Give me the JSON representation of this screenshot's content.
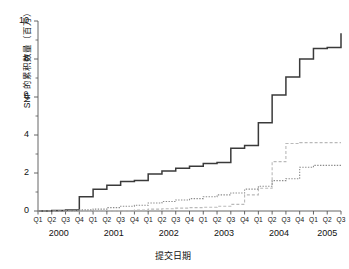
{
  "chart_data": {
    "type": "line",
    "subtype": "step",
    "title": "",
    "xlabel": "提交日期",
    "ylabel": "SNP 的累积数量（百万）",
    "ylim": [
      0,
      10
    ],
    "yticks": [
      0,
      2,
      4,
      6,
      8,
      10
    ],
    "yticks_minor": [
      1,
      3,
      5,
      7,
      9
    ],
    "grid": false,
    "legend": "none",
    "x_quarter_labels": [
      "Q1",
      "Q2",
      "Q3",
      "Q4",
      "Q1",
      "Q2",
      "Q3",
      "Q4",
      "Q1",
      "Q2",
      "Q3",
      "Q4",
      "Q1",
      "Q2",
      "Q3",
      "Q4",
      "Q1",
      "Q2",
      "Q3",
      "Q4",
      "Q1",
      "Q2",
      "Q3"
    ],
    "x_year_labels": [
      "2000",
      "2001",
      "2002",
      "2003",
      "2004",
      "2005"
    ],
    "x_year_spans": [
      4,
      4,
      4,
      4,
      4,
      3
    ],
    "x": [
      "2000Q1",
      "2000Q2",
      "2000Q3",
      "2000Q4",
      "2001Q1",
      "2001Q2",
      "2001Q3",
      "2001Q4",
      "2002Q1",
      "2002Q2",
      "2002Q3",
      "2002Q4",
      "2003Q1",
      "2003Q2",
      "2003Q3",
      "2003Q4",
      "2004Q1",
      "2004Q2",
      "2004Q3",
      "2004Q4",
      "2005Q1",
      "2005Q2",
      "2005Q3"
    ],
    "series": [
      {
        "name": "submitted-snps-total",
        "style": "solid",
        "color": "#3a3a3a",
        "values": [
          0.0,
          0.02,
          0.05,
          0.75,
          1.15,
          1.35,
          1.55,
          1.6,
          1.95,
          2.1,
          2.25,
          2.35,
          2.5,
          2.55,
          3.3,
          3.45,
          4.65,
          6.1,
          7.05,
          8.0,
          8.55,
          8.6,
          9.35
        ]
      },
      {
        "name": "validated-snps",
        "style": "dashed",
        "color": "#b9b9b9",
        "values": [
          0.0,
          0.0,
          0.0,
          0.0,
          0.0,
          0.0,
          0.0,
          0.05,
          0.1,
          0.12,
          0.15,
          0.18,
          0.2,
          0.25,
          0.35,
          0.85,
          1.2,
          2.6,
          3.55,
          3.6,
          3.6,
          3.6,
          3.6
        ]
      },
      {
        "name": "reference-snps",
        "style": "dotted",
        "color": "#8c8c8c",
        "values": [
          0.0,
          0.0,
          0.02,
          0.06,
          0.1,
          0.18,
          0.25,
          0.3,
          0.42,
          0.5,
          0.58,
          0.65,
          0.75,
          0.85,
          0.95,
          1.15,
          1.3,
          1.6,
          1.7,
          2.3,
          2.4,
          2.4,
          2.4
        ]
      }
    ]
  }
}
